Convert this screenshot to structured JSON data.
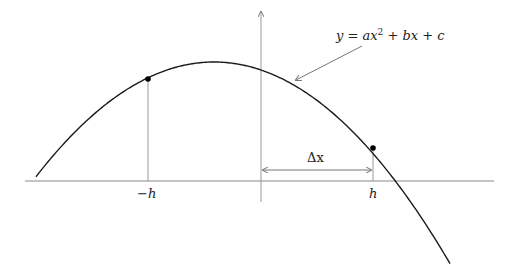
{
  "diagram": {
    "equation_label": "y = ax² + bx + c",
    "points": [
      {
        "name": "left-point",
        "label": "−h",
        "x": 148,
        "y": 79
      },
      {
        "name": "right-point",
        "label": "h",
        "x": 373,
        "y": 148
      }
    ],
    "delta_label": "Δx",
    "axes": {
      "x_axis_y": 181,
      "x_start": 25,
      "x_end": 494,
      "y_axis_x": 261,
      "y_top": 10,
      "y_bottom": 202
    },
    "curve": {
      "vertex_x": 214,
      "vertex_y": 62,
      "k": 0.00362,
      "x_from": 36,
      "x_to": 450
    },
    "colors": {
      "axis": "#888888",
      "curve": "#1a1a1a",
      "guide": "#999999",
      "text": "#222222"
    }
  }
}
